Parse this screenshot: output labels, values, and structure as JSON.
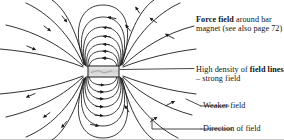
{
  "figure": {
    "type": "magnetic-field-line-diagram",
    "magnet": {
      "shape": "rectangle",
      "fill_color": "#d8d8d8",
      "border_color": "#1a1a1a",
      "x": 88,
      "y": 66,
      "width": 31,
      "height": 11
    },
    "colors": {
      "field_line": "#1a1a1a",
      "leader_line": "#1a1a1a",
      "background": "#ffffff",
      "frame": "#c9c9c9"
    },
    "field_line_count": 26,
    "arrow_direction": "right-pole to left-pole (around outside)"
  },
  "callouts": [
    {
      "id": "force-field",
      "bold_text": "Force field",
      "rest_text": " around bar magnet (see also page 72)",
      "full_text": "Force field around bar magnet (see also page 72)"
    },
    {
      "id": "field-lines",
      "lead_text": "High density of ",
      "bold_text": "field lines",
      "rest_text": " – strong field",
      "full_text": "High density of field lines – strong field"
    },
    {
      "id": "weaker-field",
      "full_text": "Weaker field"
    },
    {
      "id": "direction-of-field",
      "full_text": "Direction of field"
    }
  ]
}
